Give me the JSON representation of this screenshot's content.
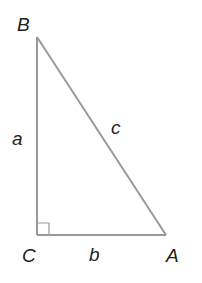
{
  "diagram": {
    "type": "right-triangle",
    "line_color": "#999999",
    "label_color": "#222222",
    "vertices": [
      {
        "name": "B",
        "label": "B",
        "x": 37,
        "y": 37
      },
      {
        "name": "C",
        "label": "C",
        "x": 37,
        "y": 235
      },
      {
        "name": "A",
        "label": "A",
        "x": 166,
        "y": 235
      }
    ],
    "sides": [
      {
        "name": "a",
        "label": "a",
        "from": "B",
        "to": "C"
      },
      {
        "name": "b",
        "label": "b",
        "from": "C",
        "to": "A"
      },
      {
        "name": "c",
        "label": "c",
        "from": "B",
        "to": "A"
      }
    ],
    "right_angle_at": "C"
  }
}
